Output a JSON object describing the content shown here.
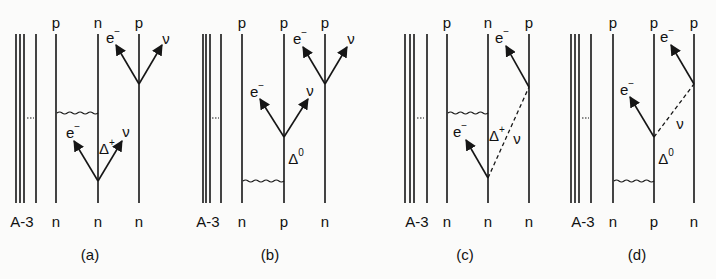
{
  "figure": {
    "panels": [
      {
        "id": "a",
        "caption": "(a)",
        "caption_pos": [
          90,
          254
        ],
        "core_lines_x": [
          16,
          20,
          24,
          36
        ],
        "core_dash": [
          27,
          34,
          118
        ],
        "core_label": "A-3",
        "core_label_pos": [
          22,
          221
        ],
        "nucleons": [
          {
            "x": 56,
            "top": "p",
            "bottom": "n"
          },
          {
            "x": 98,
            "top": "n",
            "bottom": "n"
          },
          {
            "x": 139,
            "top": "p",
            "bottom": "n"
          }
        ],
        "line_top": 34,
        "line_bottom": 203,
        "top_label_y": 22,
        "bottom_label_y": 221,
        "wavy": {
          "x1": 57,
          "x2": 98,
          "y": 113
        },
        "arrows": [
          {
            "from": [
              139,
              84
            ],
            "to": [
              116,
              45
            ],
            "label": "e",
            "sup": "−",
            "label_pos": [
              113,
              37
            ]
          },
          {
            "from": [
              139,
              84
            ],
            "to": [
              162,
              45
            ],
            "label": "ν",
            "sup": "",
            "label_pos": [
              166,
              38
            ]
          },
          {
            "from": [
              98,
              181
            ],
            "to": [
              74,
              141
            ],
            "label": "e",
            "sup": "−",
            "label_pos": [
              73,
              132
            ]
          },
          {
            "from": [
              98,
              181
            ],
            "to": [
              122,
              141
            ],
            "label": "ν",
            "sup": "",
            "label_pos": [
              126,
              131
            ]
          }
        ],
        "dashed": [],
        "delta": {
          "text": "Δ",
          "sup": "+",
          "pos": [
            107,
            148
          ]
        }
      },
      {
        "id": "b",
        "caption": "(b)",
        "caption_pos": [
          270,
          254
        ],
        "core_lines_x": [
          203,
          206,
          210,
          221
        ],
        "core_dash": [
          212,
          219,
          118
        ],
        "core_label": "A-3",
        "core_label_pos": [
          208,
          221
        ],
        "nucleons": [
          {
            "x": 242,
            "top": "p",
            "bottom": "n"
          },
          {
            "x": 284,
            "top": "p",
            "bottom": "p"
          },
          {
            "x": 325,
            "top": "p",
            "bottom": "n"
          }
        ],
        "line_top": 34,
        "line_bottom": 203,
        "top_label_y": 22,
        "bottom_label_y": 221,
        "wavy": {
          "x1": 243,
          "x2": 284,
          "y": 181
        },
        "arrows": [
          {
            "from": [
              325,
              84
            ],
            "to": [
              303,
              47
            ],
            "label": "e",
            "sup": "−",
            "label_pos": [
              300,
              38
            ]
          },
          {
            "from": [
              325,
              84
            ],
            "to": [
              347,
              47
            ],
            "label": "ν",
            "sup": "",
            "label_pos": [
              351,
              38
            ]
          },
          {
            "from": [
              284,
              137
            ],
            "to": [
              260,
              99
            ],
            "label": "e",
            "sup": "−",
            "label_pos": [
              257,
              91
            ]
          },
          {
            "from": [
              284,
              137
            ],
            "to": [
              308,
              99
            ],
            "label": "ν",
            "sup": "",
            "label_pos": [
              310,
              90
            ]
          }
        ],
        "dashed": [],
        "delta": {
          "text": "Δ",
          "sup": "0",
          "pos": [
            296,
            158
          ]
        }
      },
      {
        "id": "c",
        "caption": "(c)",
        "caption_pos": [
          465,
          254
        ],
        "core_lines_x": [
          405,
          410,
          414,
          427
        ],
        "core_dash": [
          417,
          424,
          118
        ],
        "core_label": "A-3",
        "core_label_pos": [
          417,
          221
        ],
        "nucleons": [
          {
            "x": 447,
            "top": "p",
            "bottom": "n"
          },
          {
            "x": 488,
            "top": "n",
            "bottom": "n"
          },
          {
            "x": 529,
            "top": "p",
            "bottom": "n"
          }
        ],
        "line_top": 34,
        "line_bottom": 203,
        "top_label_y": 22,
        "bottom_label_y": 221,
        "wavy": {
          "x1": 448,
          "x2": 488,
          "y": 113
        },
        "arrows": [
          {
            "from": [
              529,
              87
            ],
            "to": [
              506,
              46
            ],
            "label": "e",
            "sup": "−",
            "label_pos": [
              502,
              37
            ]
          },
          {
            "from": [
              488,
              178
            ],
            "to": [
              466,
              140
            ],
            "label": "e",
            "sup": "−",
            "label_pos": [
              460,
              131
            ]
          }
        ],
        "dashed": [
          {
            "from": [
              488,
              178
            ],
            "to": [
              529,
              87
            ],
            "label": "ν",
            "label_pos": [
              517,
              138
            ]
          }
        ],
        "delta": {
          "text": "Δ",
          "sup": "+",
          "pos": [
            497,
            135
          ]
        }
      },
      {
        "id": "d",
        "caption": "(d)",
        "caption_pos": [
          637,
          254
        ],
        "core_lines_x": [
          571,
          575,
          579,
          591
        ],
        "core_dash": [
          582,
          589,
          118
        ],
        "core_label": "A-3",
        "core_label_pos": [
          583,
          221
        ],
        "nucleons": [
          {
            "x": 613,
            "top": "p",
            "bottom": "n"
          },
          {
            "x": 654,
            "top": "p",
            "bottom": "p"
          },
          {
            "x": 694,
            "top": "p",
            "bottom": "n"
          }
        ],
        "line_top": 34,
        "line_bottom": 203,
        "top_label_y": 22,
        "bottom_label_y": 221,
        "wavy": {
          "x1": 614,
          "x2": 654,
          "y": 181
        },
        "arrows": [
          {
            "from": [
              694,
              84
            ],
            "to": [
              671,
              45
            ],
            "label": "e",
            "sup": "−",
            "label_pos": [
              667,
              36
            ]
          },
          {
            "from": [
              654,
              137
            ],
            "to": [
              630,
              97
            ],
            "label": "e",
            "sup": "−",
            "label_pos": [
              627,
              89
            ]
          }
        ],
        "dashed": [
          {
            "from": [
              654,
              137
            ],
            "to": [
              694,
              84
            ],
            "label": "ν",
            "label_pos": [
              680,
              123
            ]
          }
        ],
        "delta": {
          "text": "Δ",
          "sup": "0",
          "pos": [
            666,
            158
          ]
        }
      }
    ],
    "colors": {
      "ink": "#161616",
      "background": "#fbfbfa"
    }
  }
}
